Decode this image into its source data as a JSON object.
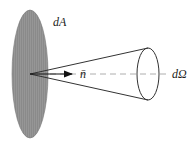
{
  "diagram": {
    "labels": {
      "area": "dA",
      "normal": "n̄",
      "solid_angle": "dΩ"
    },
    "colors": {
      "surface_fill": "#8c8c8c",
      "stroke": "#333333",
      "dashed_axis": "#999999"
    }
  }
}
